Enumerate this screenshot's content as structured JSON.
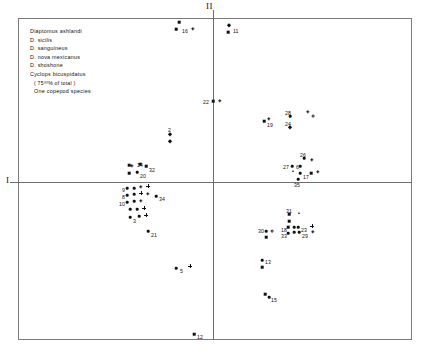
{
  "chart_data": {
    "type": "scatter",
    "title": "",
    "subtitle": "",
    "xlabel": "II",
    "ylabel": "I",
    "grid": false,
    "legend_position": "top-left-inside",
    "axis_labels": {
      "horizontal": "I",
      "vertical": "II"
    },
    "axis_origin_px": {
      "x": 213,
      "y": 182
    },
    "legend": {
      "entries": [
        {
          "label": "Diaptomus ashlandi",
          "symbol": "filled-diamond",
          "glyph": "diamond"
        },
        {
          "label": "D. sicilis",
          "symbol": "filled-square",
          "glyph": "square"
        },
        {
          "label": "D. sanguineus",
          "symbol": "filled-triangle",
          "glyph": "triangle"
        },
        {
          "label": "D. nova mexicanus",
          "symbol": "asterisk",
          "glyph": "star"
        },
        {
          "label": "D. shoshone",
          "symbol": "open-circle",
          "glyph": "circle"
        },
        {
          "label": "Cyclops bicuspidatus",
          "symbol": "plus",
          "glyph": "plus"
        }
      ],
      "note": "( 75⁰⁰% of total )",
      "footer": {
        "label": "One copepod species",
        "symbol": "filled-diamond",
        "glyph": "diamond"
      }
    },
    "points": [
      {
        "id": "16",
        "label": "16",
        "glyph": "square",
        "x": 179,
        "y": 22,
        "lx": 182,
        "ly": 28
      },
      {
        "id": "16b",
        "label": "",
        "glyph": "square",
        "x": 176,
        "y": 29,
        "lx": 0,
        "ly": 0
      },
      {
        "id": "16c",
        "label": "",
        "glyph": "star",
        "x": 193,
        "y": 29,
        "lx": 0,
        "ly": 0
      },
      {
        "id": "11",
        "label": "11",
        "glyph": "diamond",
        "x": 229,
        "y": 25,
        "lx": 233,
        "ly": 28
      },
      {
        "id": "11b",
        "label": "",
        "glyph": "square",
        "x": 228,
        "y": 32,
        "lx": 0,
        "ly": 0
      },
      {
        "id": "22",
        "label": "22",
        "glyph": "square",
        "x": 213,
        "y": 101,
        "lx": 203,
        "ly": 99
      },
      {
        "id": "22b",
        "label": "",
        "glyph": "star",
        "x": 220,
        "y": 101,
        "lx": 0,
        "ly": 0
      },
      {
        "id": "28",
        "label": "28",
        "glyph": "dot",
        "x": 290,
        "y": 116,
        "lx": 285,
        "ly": 110
      },
      {
        "id": "24",
        "label": "24",
        "glyph": "diamond",
        "x": 290,
        "y": 127,
        "lx": 285,
        "ly": 121
      },
      {
        "id": "19",
        "label": "19",
        "glyph": "square",
        "x": 264,
        "y": 121,
        "lx": 267,
        "ly": 122
      },
      {
        "id": "19b",
        "label": "",
        "glyph": "star",
        "x": 269,
        "y": 119,
        "lx": 0,
        "ly": 0
      },
      {
        "id": "sh1",
        "label": "",
        "glyph": "circle",
        "x": 313,
        "y": 116,
        "lx": 0,
        "ly": 0
      },
      {
        "id": "sh2",
        "label": "",
        "glyph": "star",
        "x": 308,
        "y": 112,
        "lx": 0,
        "ly": 0
      },
      {
        "id": "2",
        "label": "2",
        "glyph": "diamond",
        "x": 170,
        "y": 134,
        "lx": 168,
        "ly": 127
      },
      {
        "id": "2b",
        "label": "",
        "glyph": "diamond",
        "x": 170,
        "y": 141,
        "lx": 0,
        "ly": 0
      },
      {
        "id": "14",
        "label": "14",
        "glyph": "square",
        "x": 140,
        "y": 164,
        "lx": 137,
        "ly": 162
      },
      {
        "id": "14b",
        "label": "",
        "glyph": "star",
        "x": 132,
        "y": 166,
        "lx": 0,
        "ly": 0
      },
      {
        "id": "14c",
        "label": "",
        "glyph": "square",
        "x": 129,
        "y": 165,
        "lx": 0,
        "ly": 0
      },
      {
        "id": "32",
        "label": "32",
        "glyph": "square",
        "x": 146,
        "y": 166,
        "lx": 149,
        "ly": 167
      },
      {
        "id": "20",
        "label": "20",
        "glyph": "dot",
        "x": 137,
        "y": 172,
        "lx": 140,
        "ly": 173
      },
      {
        "id": "20b",
        "label": "",
        "glyph": "square",
        "x": 129,
        "y": 173,
        "lx": 0,
        "ly": 0
      },
      {
        "id": "26",
        "label": "26",
        "glyph": "dot",
        "x": 304,
        "y": 158,
        "lx": 300,
        "ly": 152
      },
      {
        "id": "26b",
        "label": "",
        "glyph": "star",
        "x": 312,
        "y": 160,
        "lx": 0,
        "ly": 0
      },
      {
        "id": "27",
        "label": "27",
        "glyph": "dot",
        "x": 292,
        "y": 166,
        "lx": 283,
        "ly": 164
      },
      {
        "id": "6",
        "label": "6",
        "glyph": "dot",
        "x": 300,
        "y": 166,
        "lx": 296,
        "ly": 164
      },
      {
        "id": "6b",
        "label": "",
        "glyph": "triangle",
        "x": 293,
        "y": 171,
        "lx": 0,
        "ly": 0
      },
      {
        "id": "17",
        "label": "17",
        "glyph": "dot",
        "x": 300,
        "y": 173,
        "lx": 303,
        "ly": 174
      },
      {
        "id": "17b",
        "label": "",
        "glyph": "square",
        "x": 311,
        "y": 173,
        "lx": 0,
        "ly": 0
      },
      {
        "id": "17c",
        "label": "",
        "glyph": "star",
        "x": 318,
        "y": 172,
        "lx": 0,
        "ly": 0
      },
      {
        "id": "35",
        "label": "35",
        "glyph": "dot",
        "x": 298,
        "y": 179,
        "lx": 294,
        "ly": 182
      },
      {
        "id": "9",
        "label": "9",
        "glyph": "dot",
        "x": 127,
        "y": 188,
        "lx": 122,
        "ly": 187
      },
      {
        "id": "9b",
        "label": "",
        "glyph": "dot",
        "x": 134,
        "y": 188,
        "lx": 0,
        "ly": 0
      },
      {
        "id": "9c",
        "label": "",
        "glyph": "star",
        "x": 141,
        "y": 187,
        "lx": 0,
        "ly": 0
      },
      {
        "id": "9d",
        "label": "",
        "glyph": "plus",
        "x": 148,
        "y": 186,
        "lx": 0,
        "ly": 0
      },
      {
        "id": "8",
        "label": "8",
        "glyph": "dot",
        "x": 127,
        "y": 195,
        "lx": 122,
        "ly": 194
      },
      {
        "id": "8b",
        "label": "",
        "glyph": "dot",
        "x": 134,
        "y": 194,
        "lx": 0,
        "ly": 0
      },
      {
        "id": "8c",
        "label": "",
        "glyph": "plus",
        "x": 141,
        "y": 193,
        "lx": 0,
        "ly": 0
      },
      {
        "id": "8d",
        "label": "",
        "glyph": "star",
        "x": 148,
        "y": 194,
        "lx": 0,
        "ly": 0
      },
      {
        "id": "34",
        "label": "34",
        "glyph": "dot",
        "x": 156,
        "y": 196,
        "lx": 159,
        "ly": 196
      },
      {
        "id": "10",
        "label": "10",
        "glyph": "dot",
        "x": 127,
        "y": 202,
        "lx": 119,
        "ly": 201
      },
      {
        "id": "10b",
        "label": "",
        "glyph": "dot",
        "x": 134,
        "y": 201,
        "lx": 0,
        "ly": 0
      },
      {
        "id": "10c",
        "label": "",
        "glyph": "star",
        "x": 141,
        "y": 201,
        "lx": 0,
        "ly": 0
      },
      {
        "id": "r4a",
        "label": "",
        "glyph": "dot",
        "x": 130,
        "y": 209,
        "lx": 0,
        "ly": 0
      },
      {
        "id": "r4b",
        "label": "",
        "glyph": "dot",
        "x": 137,
        "y": 209,
        "lx": 0,
        "ly": 0
      },
      {
        "id": "r4c",
        "label": "",
        "glyph": "plus",
        "x": 144,
        "y": 208,
        "lx": 0,
        "ly": 0
      },
      {
        "id": "3",
        "label": "3",
        "glyph": "dot",
        "x": 130,
        "y": 217,
        "lx": 133,
        "ly": 218
      },
      {
        "id": "3b",
        "label": "",
        "glyph": "dot",
        "x": 139,
        "y": 216,
        "lx": 0,
        "ly": 0
      },
      {
        "id": "3c",
        "label": "",
        "glyph": "plus",
        "x": 146,
        "y": 215,
        "lx": 0,
        "ly": 0
      },
      {
        "id": "21",
        "label": "21",
        "glyph": "dot",
        "x": 148,
        "y": 231,
        "lx": 151,
        "ly": 232
      },
      {
        "id": "31",
        "label": "31",
        "glyph": "square",
        "x": 289,
        "y": 214,
        "lx": 286,
        "ly": 208
      },
      {
        "id": "31b",
        "label": "",
        "glyph": "square",
        "x": 289,
        "y": 221,
        "lx": 0,
        "ly": 0
      },
      {
        "id": "31c",
        "label": "",
        "glyph": "triangle",
        "x": 299,
        "y": 213,
        "lx": 0,
        "ly": 0
      },
      {
        "id": "18",
        "label": "18",
        "glyph": "square",
        "x": 288,
        "y": 227,
        "lx": 281,
        "ly": 227
      },
      {
        "id": "18b",
        "label": "",
        "glyph": "dot",
        "x": 294,
        "y": 227,
        "lx": 0,
        "ly": 0
      },
      {
        "id": "23",
        "label": "23",
        "glyph": "dot",
        "x": 298,
        "y": 227,
        "lx": 301,
        "ly": 227
      },
      {
        "id": "23b",
        "label": "",
        "glyph": "plus",
        "x": 312,
        "y": 226,
        "lx": 0,
        "ly": 0
      },
      {
        "id": "33",
        "label": "33",
        "glyph": "dot",
        "x": 288,
        "y": 233,
        "lx": 281,
        "ly": 233
      },
      {
        "id": "33b",
        "label": "",
        "glyph": "dot",
        "x": 294,
        "y": 232,
        "lx": 0,
        "ly": 0
      },
      {
        "id": "29",
        "label": "29",
        "glyph": "dot",
        "x": 299,
        "y": 232,
        "lx": 302,
        "ly": 233
      },
      {
        "id": "29b",
        "label": "",
        "glyph": "star",
        "x": 313,
        "y": 232,
        "lx": 0,
        "ly": 0
      },
      {
        "id": "30",
        "label": "30",
        "glyph": "dot",
        "x": 266,
        "y": 231,
        "lx": 258,
        "ly": 228
      },
      {
        "id": "30b",
        "label": "",
        "glyph": "circle",
        "x": 272,
        "y": 231,
        "lx": 0,
        "ly": 0
      },
      {
        "id": "30c",
        "label": "",
        "glyph": "square",
        "x": 266,
        "y": 237,
        "lx": 0,
        "ly": 0
      },
      {
        "id": "5",
        "label": "5",
        "glyph": "dot",
        "x": 176,
        "y": 268,
        "lx": 180,
        "ly": 268
      },
      {
        "id": "5b",
        "label": "",
        "glyph": "plus",
        "x": 190,
        "y": 266,
        "lx": 0,
        "ly": 0
      },
      {
        "id": "13",
        "label": "13",
        "glyph": "dot",
        "x": 262,
        "y": 260,
        "lx": 265,
        "ly": 259
      },
      {
        "id": "13b",
        "label": "",
        "glyph": "square",
        "x": 262,
        "y": 267,
        "lx": 0,
        "ly": 0
      },
      {
        "id": "15",
        "label": "15",
        "glyph": "square",
        "x": 265,
        "y": 294,
        "lx": 271,
        "ly": 297
      },
      {
        "id": "15b",
        "label": "",
        "glyph": "dot",
        "x": 269,
        "y": 297,
        "lx": 0,
        "ly": 0
      },
      {
        "id": "12",
        "label": "12",
        "glyph": "square",
        "x": 194,
        "y": 334,
        "lx": 197,
        "ly": 334
      }
    ]
  }
}
